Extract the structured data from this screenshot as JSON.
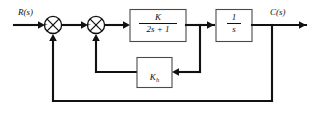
{
  "diagram": {
    "background_color": "#ffffff",
    "line_color": "#111111",
    "box_border_color": "#4a4a52",
    "signals": {
      "input_label": "R(s)",
      "output_label": "C(s)"
    },
    "summing_junctions": [
      {
        "name": "outer-summing-junction",
        "left_sign": "+",
        "bottom_sign": "–"
      },
      {
        "name": "inner-summing-junction",
        "left_sign": "+",
        "bottom_sign": "–"
      }
    ],
    "blocks": [
      {
        "name": "plant-transfer-function-block",
        "numerator": "K",
        "denominator": "2s + 1",
        "type": "fraction"
      },
      {
        "name": "integrator-block",
        "numerator": "1",
        "denominator": "s",
        "type": "fraction"
      },
      {
        "name": "rate-feedback-gain-block",
        "gain": "K",
        "gain_subscript": "h",
        "type": "gain"
      }
    ],
    "feedback_paths": [
      {
        "name": "inner-feedback-path",
        "source": "plant-transfer-function-block",
        "target": "inner-summing-junction",
        "element": "rate-feedback-gain-block"
      },
      {
        "name": "outer-feedback-path",
        "source": "integrator-block",
        "target": "outer-summing-junction",
        "element": "unity"
      }
    ]
  }
}
